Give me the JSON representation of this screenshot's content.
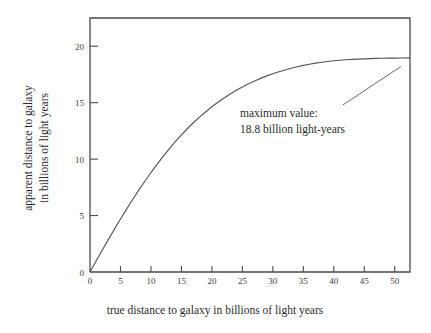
{
  "chart_data": {
    "type": "line",
    "title": "",
    "xlabel": "true distance to galaxy in billions of light years",
    "ylabel_line1": "apparent distance to galaxy",
    "ylabel_line2": "in billions of light years",
    "xlim": [
      0,
      52.5
    ],
    "ylim": [
      0,
      22.5
    ],
    "grid": false,
    "legend": null,
    "xticks": [
      0,
      5,
      10,
      15,
      20,
      25,
      30,
      35,
      40,
      45,
      50
    ],
    "xtick_labels": [
      "0",
      "5",
      "10",
      "15",
      "20",
      "25",
      "30",
      "35",
      "40",
      "45",
      "50"
    ],
    "yticks": [
      0,
      5,
      10,
      15,
      20
    ],
    "ytick_labels": [
      "0",
      "5",
      "10",
      "15",
      "20"
    ],
    "annotations": [
      {
        "name": "maximum-value-annotation",
        "line1": "maximum value:",
        "line2": "18.8 billion light-years",
        "leader_from_x": 41.5,
        "leader_from_y": 14.8,
        "leader_to_x": 51.0,
        "leader_to_y": 18.2
      }
    ],
    "asymptote": 18.8,
    "series": [
      {
        "name": "apparent distance",
        "color": "#555555",
        "x": [
          0,
          1,
          2,
          3,
          4,
          5,
          6,
          7,
          8,
          9,
          10,
          11,
          12,
          13,
          14,
          15,
          16,
          17,
          18,
          19,
          20,
          21,
          22,
          23,
          24,
          25,
          26,
          27,
          28,
          29,
          30,
          31,
          32,
          33,
          34,
          35,
          36,
          37,
          38,
          39,
          40,
          41,
          42,
          43,
          44,
          45,
          46,
          47,
          48,
          49,
          50,
          51,
          52.5
        ],
        "y": [
          0,
          0.97,
          1.93,
          2.87,
          3.79,
          4.69,
          5.57,
          6.42,
          7.25,
          8.04,
          8.81,
          9.54,
          10.24,
          10.91,
          11.54,
          12.14,
          12.71,
          13.24,
          13.74,
          14.2,
          14.64,
          15.04,
          15.42,
          15.77,
          16.09,
          16.39,
          16.67,
          16.92,
          17.15,
          17.37,
          17.56,
          17.74,
          17.9,
          18.05,
          18.18,
          18.3,
          18.4,
          18.5,
          18.58,
          18.65,
          18.71,
          18.76,
          18.8,
          18.83,
          18.86,
          18.88,
          18.9,
          18.92,
          18.93,
          18.94,
          18.95,
          18.96,
          18.97
        ]
      }
    ],
    "colors": {
      "background": "#ffffff",
      "axis": "#4a4a4a",
      "curve": "#555555",
      "text": "#2b2b2b"
    }
  }
}
